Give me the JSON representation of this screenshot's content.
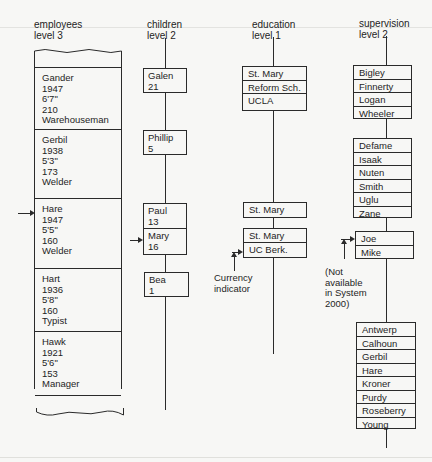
{
  "columns": {
    "employees": {
      "name": "employees",
      "level": "level 3"
    },
    "children": {
      "name": "children",
      "level": "level 2"
    },
    "education": {
      "name": "education",
      "level": "level 1"
    },
    "supervision": {
      "name": "supervision",
      "level": "level 2"
    }
  },
  "employees": [
    {
      "name": "Gander",
      "born": "1947",
      "height": "6'7\"",
      "weight": "210",
      "job": "Warehouseman"
    },
    {
      "name": "Gerbil",
      "born": "1938",
      "height": "5'3\"",
      "weight": "173",
      "job": "Welder"
    },
    {
      "name": "Hare",
      "born": "1947",
      "height": "5'5\"",
      "weight": "160",
      "job": "Welder"
    },
    {
      "name": "Hart",
      "born": "1936",
      "height": "5'8\"",
      "weight": "160",
      "job": "Typist"
    },
    {
      "name": "Hawk",
      "born": "1921",
      "height": "5'6\"",
      "weight": "153",
      "job": "Manager"
    }
  ],
  "children": [
    [
      {
        "name": "Galen",
        "age": "21"
      }
    ],
    [
      {
        "name": "Phillip",
        "age": "5"
      }
    ],
    [
      {
        "name": "Paul",
        "age": "13"
      },
      {
        "name": "Mary",
        "age": "16"
      }
    ],
    [
      {
        "name": "Bea",
        "age": "1"
      }
    ]
  ],
  "education": [
    [
      "St. Mary",
      "Reform Sch.",
      "UCLA"
    ],
    [
      "St. Mary"
    ],
    [
      "St. Mary",
      "UC Berk."
    ]
  ],
  "supervision": [
    [
      "Bigley",
      "Finnerty",
      "Logan",
      "Wheeler"
    ],
    [
      "Defame",
      "Isaak",
      "Nuten",
      "Smith",
      "Uglu",
      "Zane"
    ],
    [
      "Joe",
      "Mike"
    ],
    [
      "Antwerp",
      "Calhoun",
      "Gerbil",
      "Hare",
      "Kroner",
      "Purdy",
      "Roseberry",
      "Young"
    ]
  ],
  "annotations": {
    "currency_indicator": [
      "Currency",
      "indicator"
    ],
    "not_available": [
      "(Not",
      "available",
      "in System",
      "2000)"
    ]
  },
  "colors": {
    "line": "#2a2a2a",
    "background": "#f7f7f5",
    "text": "#1e1e1e"
  }
}
